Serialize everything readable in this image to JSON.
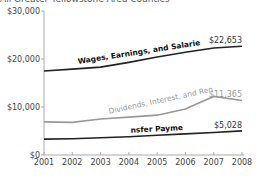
{
  "title": "All Greater Yellowstone Area Counties",
  "chart_data": {
    "type": "line",
    "title": "All Greater Yellowstone Area Counties",
    "xlabel": "",
    "ylabel": "",
    "x": [
      2001,
      2002,
      2003,
      2004,
      2005,
      2006,
      2007,
      2008
    ],
    "ylim": [
      0,
      30000
    ],
    "yticks": [
      "$0",
      "$10,000",
      "$20,000",
      "$30,000"
    ],
    "xticks": [
      "2001",
      "2002",
      "2003",
      "2004",
      "2005",
      "2006",
      "2007",
      "2008"
    ],
    "grid": false,
    "legend": "inline labels on lines",
    "series": [
      {
        "name": "Wages, Earnings, and Salaries",
        "color": "#222222",
        "values": [
          17500,
          17900,
          18300,
          19300,
          20400,
          21400,
          22300,
          22653
        ],
        "end_label": "$22,653"
      },
      {
        "name": "Dividends, Interest, and Rent",
        "color": "#999999",
        "values": [
          6900,
          6800,
          7500,
          7900,
          8300,
          9600,
          12200,
          11365
        ],
        "end_label": "$11,365"
      },
      {
        "name": "Transfer Payments",
        "color": "#222222",
        "values": [
          3300,
          3400,
          3600,
          3800,
          4100,
          4400,
          4700,
          5028
        ],
        "end_label": "$5,028"
      }
    ]
  }
}
